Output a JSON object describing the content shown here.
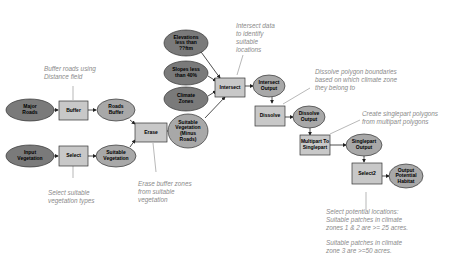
{
  "colors": {
    "input_oval": "#7a7a7a",
    "derived_oval": "#a8a8a8",
    "tool_box": "#c8c8c8",
    "stroke": "#333333",
    "connector": "#222222",
    "annotation_line": "#9a9a9a",
    "annotation_text": "#8a8a8a"
  },
  "inputs": {
    "major_roads": "Major\nRoads",
    "input_vegetation": "Input\nVegetation",
    "elevations": "Elevations\nless than\n??ftm",
    "slopes": "Slopes less\nthan 40%",
    "climate_zones": "Climate\nZones"
  },
  "tools": {
    "buffer": "Buffer",
    "select": "Select",
    "erase": "Erase",
    "intersect": "Intersect",
    "dissolve": "Dissolve",
    "multipart": "Multipart To\nSinglepart",
    "select2": "Select2"
  },
  "outputs": {
    "roads_buffer": "Roads\nBuffer",
    "suitable_vegetation": "Suitable\nVegetation",
    "suitable_veg_minus_roads": "Suitable\nVegetation\n(Minus\nRoads)",
    "intersect_output": "Intersect\nOutput",
    "dissolve_output": "Dissolve\nOutput",
    "singlepart_output": "Singlepart\nOutput",
    "output_potential_habitat": "Output\nPotential\nHabitat"
  },
  "annotations": {
    "buffer_note": "Buffer roads using\nDistance field",
    "select_note": "Select suitable\nvegetation types",
    "erase_note": "Erase buffer zones\nfrom suitable\nvegetation",
    "intersect_note": "Intersect data\nto identify\nsuitable\nlocations",
    "dissolve_note": "Dissolve polygon boundaries\nbased on which climate zone\nthey belong to",
    "singlepart_note": "Create singlepart polygons\nfrom multipart polygons",
    "select2_note_1": "Select potential locations:\nSuitable patches in climate\nzones 1 & 2 are >= 25 acres.",
    "select2_note_2": "Suitable patches in climate\nzone 3 are >=50 acres."
  }
}
